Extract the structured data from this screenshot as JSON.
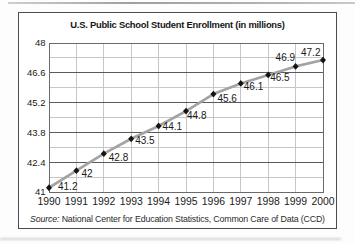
{
  "figure": {
    "border_color": "#4c4c4c",
    "background": "#ffffff"
  },
  "source": {
    "label": "Source:",
    "text": " National Center for Education Statistics, Common Care of Data (CCD)"
  },
  "chart_data": {
    "type": "line",
    "title": "U.S. Public School Student Enrollment (in millions)",
    "x": [
      1990,
      1991,
      1992,
      1993,
      1994,
      1995,
      1996,
      1997,
      1998,
      1999,
      2000
    ],
    "values": [
      41.2,
      42,
      42.8,
      43.5,
      44.1,
      44.8,
      45.6,
      46.1,
      46.5,
      46.9,
      47.2
    ],
    "point_labels": [
      "41.2",
      "42",
      "42.8",
      "43.5",
      "44.1",
      "44.8",
      "45.6",
      "46.1",
      "46.5",
      "46.9",
      "47.2"
    ],
    "xlabel": "",
    "ylabel": "",
    "ylim": [
      41,
      48
    ],
    "ytick_values": [
      41,
      42.4,
      43.8,
      45.2,
      46.6,
      48
    ],
    "ytick_labels": [
      "41",
      "42.4",
      "43.8",
      "45.2",
      "46.6",
      "48"
    ],
    "minor_ytick_values": [
      41.7,
      43.1,
      44.5,
      45.9,
      47.3
    ],
    "xtick_labels": [
      "1990",
      "1991",
      "1992",
      "1993",
      "1994",
      "1995",
      "1996",
      "1997",
      "1998",
      "1999",
      "2000"
    ],
    "grid": true,
    "legend": false,
    "source_note": "Source: National Center for Education Statistics, Common Care of Data (CCD)",
    "colors": {
      "line": "#a3a3a3",
      "marker": "#141414",
      "grid_major": "#5a5a5a",
      "grid_minor": "#c6c6c6",
      "frame": "#6a6a6a",
      "text": "#1a1a1a"
    },
    "label_offsets": [
      [
        9,
        2
      ],
      [
        5,
        6
      ],
      [
        5,
        7
      ],
      [
        4,
        5
      ],
      [
        4,
        4
      ],
      [
        1,
        8
      ],
      [
        4,
        8
      ],
      [
        3,
        7
      ],
      [
        2,
        6
      ],
      [
        -20,
        -5
      ],
      [
        -22,
        -4
      ]
    ]
  }
}
